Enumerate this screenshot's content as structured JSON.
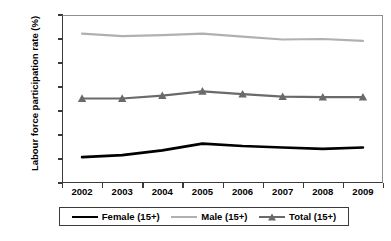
{
  "chart_data": {
    "type": "line",
    "title": "",
    "xlabel": "",
    "ylabel": "Labour force participation rate (%)",
    "categories": [
      "2002",
      "2003",
      "2004",
      "2005",
      "2006",
      "2007",
      "2008",
      "2009"
    ],
    "x": [
      2002,
      2003,
      2004,
      2005,
      2006,
      2007,
      2008,
      2009
    ],
    "ylim": [
      50.0,
      85.0
    ],
    "ytick_labels": [
      "50.0",
      "55.0",
      "60.0",
      "65.0",
      "70.0",
      "75.0",
      "80.0",
      "85.0"
    ],
    "ytick_values": [
      50.0,
      55.0,
      60.0,
      65.0,
      70.0,
      75.0,
      80.0,
      85.0
    ],
    "grid": false,
    "legend_position": "bottom",
    "series": [
      {
        "name": "Female (15+)",
        "color": "#000000",
        "width": 2.6,
        "marker": "none",
        "values": [
          55.4,
          55.8,
          56.8,
          58.2,
          57.7,
          57.4,
          57.1,
          57.4
        ]
      },
      {
        "name": "Male (15+)",
        "color": "#b0b0b0",
        "width": 2.2,
        "marker": "none",
        "values": [
          81.1,
          80.6,
          80.8,
          81.1,
          80.5,
          79.9,
          80.0,
          79.6
        ]
      },
      {
        "name": "Total (15+)",
        "color": "#6a6a6a",
        "width": 2.2,
        "marker": "triangle",
        "values": [
          67.6,
          67.6,
          68.2,
          69.1,
          68.5,
          68.0,
          67.9,
          67.9
        ]
      }
    ]
  },
  "legend": {
    "entries": [
      {
        "label": "Female (15+)"
      },
      {
        "label": "Male (15+)"
      },
      {
        "label": "Total (15+)"
      }
    ]
  }
}
